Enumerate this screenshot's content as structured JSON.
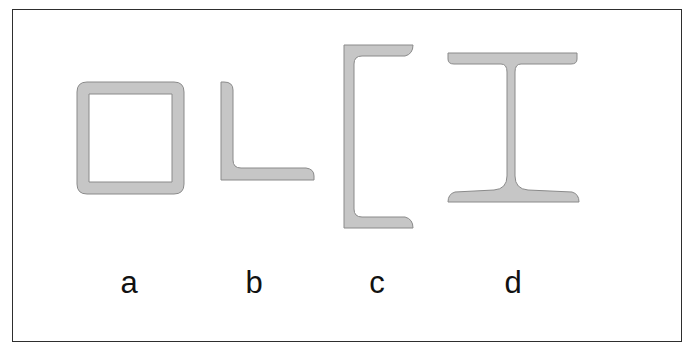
{
  "figure": {
    "fill_color": "#c6c6c6",
    "stroke_color": "#8a8a8a",
    "frame_color": "#2e2e2e",
    "profiles": [
      {
        "id": "a",
        "label": "a",
        "shape": "square hollow section (tube)",
        "label_x": 129
      },
      {
        "id": "b",
        "label": "b",
        "shape": "angle (L-section)",
        "label_x": 254
      },
      {
        "id": "c",
        "label": "c",
        "shape": "channel (C-section)",
        "label_x": 377
      },
      {
        "id": "d",
        "label": "d",
        "shape": "I-beam",
        "label_x": 513
      }
    ]
  }
}
